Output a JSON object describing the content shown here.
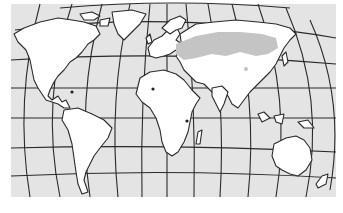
{
  "map": {
    "type": "world-map",
    "projection": "elliptical-graticule",
    "style": "monochrome-outline",
    "colors": {
      "ocean": "#e4e4e4",
      "land": "#ffffff",
      "outline": "#2a2a2a",
      "highlight_region": "#c4c4c4",
      "page_background": "#ffffff"
    },
    "highlighted_region": "Central Eurasian band (steppe)",
    "graticule": {
      "meridians": 13,
      "parallels": 9
    },
    "markers": [
      {
        "name": "west-africa-dot"
      },
      {
        "name": "east-africa-dot"
      },
      {
        "name": "caribbean-dot"
      }
    ]
  }
}
